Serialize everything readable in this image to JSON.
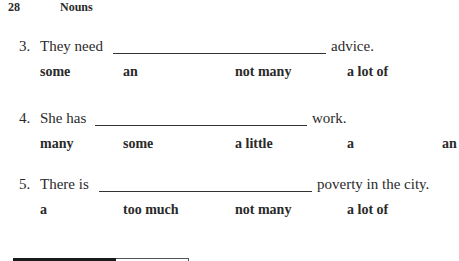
{
  "header": {
    "page_number": "28",
    "section_title": "Nouns"
  },
  "questions": [
    {
      "number": "3.",
      "before": "They need",
      "after": "advice.",
      "options": [
        "some",
        "an",
        "not many",
        "a lot of"
      ]
    },
    {
      "number": "4.",
      "before": "She has",
      "after": "work.",
      "options": [
        "many",
        "some",
        "a little",
        "a",
        "an"
      ]
    },
    {
      "number": "5.",
      "before": "There is",
      "after": "poverty in the city.",
      "options": [
        "a",
        "too much",
        "not many",
        "a lot of"
      ]
    }
  ]
}
